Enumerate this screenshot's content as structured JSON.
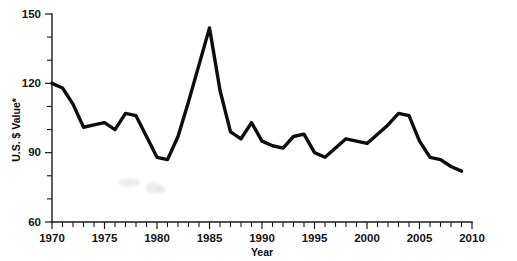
{
  "chart_data": {
    "type": "line",
    "title": "",
    "subtitle": "",
    "xlabel": "Year",
    "ylabel": "U.S. $ Value*",
    "xlim": [
      1970,
      2010
    ],
    "ylim": [
      60,
      150
    ],
    "grid": false,
    "legend": null,
    "legend_position": "none",
    "y_ticks": [
      60,
      90,
      120,
      150
    ],
    "y_tick_labels": [
      "60",
      "90",
      "120",
      "150"
    ],
    "y_minor_tick_step": 10,
    "x_ticks": [
      1970,
      1975,
      1980,
      1985,
      1990,
      1995,
      2000,
      2005,
      2010
    ],
    "x_tick_labels": [
      "1970",
      "1975",
      "1980",
      "1985",
      "1990",
      "1995",
      "2000",
      "2005",
      "2010"
    ],
    "x_minor_tick_step": 1,
    "line_color": "#0d0d0d",
    "axis_color": "#1a1a1a",
    "background_color": "#ffffff",
    "x": [
      1970,
      1971,
      1972,
      1973,
      1974,
      1975,
      1976,
      1977,
      1978,
      1979,
      1980,
      1981,
      1982,
      1983,
      1984,
      1985,
      1986,
      1987,
      1988,
      1989,
      1990,
      1991,
      1992,
      1993,
      1994,
      1995,
      1996,
      1997,
      1998,
      1999,
      2000,
      2001,
      2002,
      2003,
      2004,
      2005,
      2006,
      2007,
      2008,
      2009
    ],
    "values": [
      120,
      118,
      111,
      101,
      102,
      103,
      100,
      107,
      106,
      97,
      88,
      87,
      97,
      112,
      128,
      144,
      117,
      99,
      96,
      103,
      95,
      93,
      92,
      97,
      98,
      90,
      88,
      92,
      96,
      95,
      94,
      98,
      102,
      107,
      106,
      95,
      88,
      87,
      84,
      82
    ]
  },
  "axis": {
    "y_label": "U.S. $ Value*",
    "x_label": "Year"
  }
}
